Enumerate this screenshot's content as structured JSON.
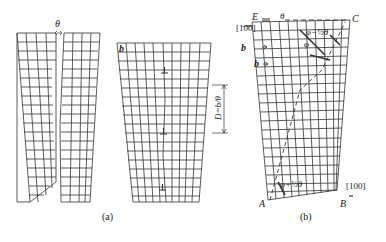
{
  "figure": {
    "panel_a": {
      "caption": "(a)",
      "theta_label": "θ",
      "burgers_label": "b",
      "spacing_label": "D=b/θ",
      "dislocation_symbol": "⊥"
    },
    "panel_b": {
      "caption": "(b)",
      "corner_labels": {
        "A": "A",
        "B": "B",
        "C": "C",
        "E": "E"
      },
      "direction_top": "[1̄00]",
      "direction_bottom": "[100]",
      "theta_label": "θ",
      "angle_top": "φ−½θ",
      "angle_left": "φ",
      "angle_bottom": "φ+½θ",
      "burgers_1": "b",
      "burgers_2": "b"
    },
    "colors": {
      "line": "#333333",
      "background": "#ffffff"
    }
  }
}
